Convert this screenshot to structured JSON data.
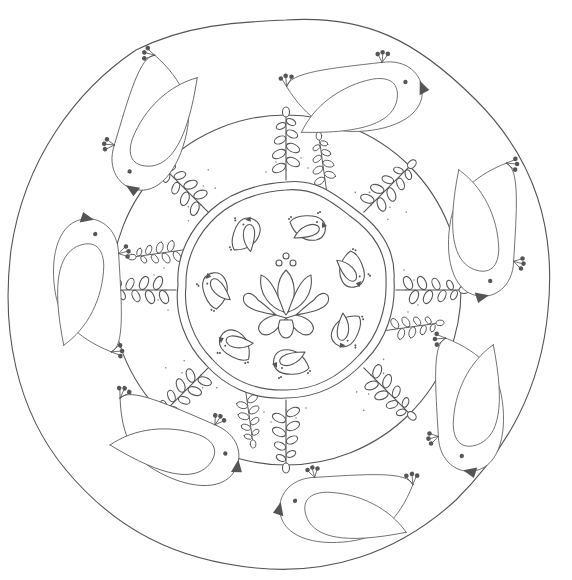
{
  "artwork": {
    "title": "Bird mandala coloring page",
    "type": "line-art coloring page",
    "outer_birds": 8,
    "inner_birds": 8,
    "fern_sprigs": 8,
    "center_motif": "lotus",
    "center_dots": 3
  },
  "colors": {
    "background": "#ffffff",
    "line": "#555555",
    "fill_dark": "#555555",
    "dots": "#888888"
  }
}
